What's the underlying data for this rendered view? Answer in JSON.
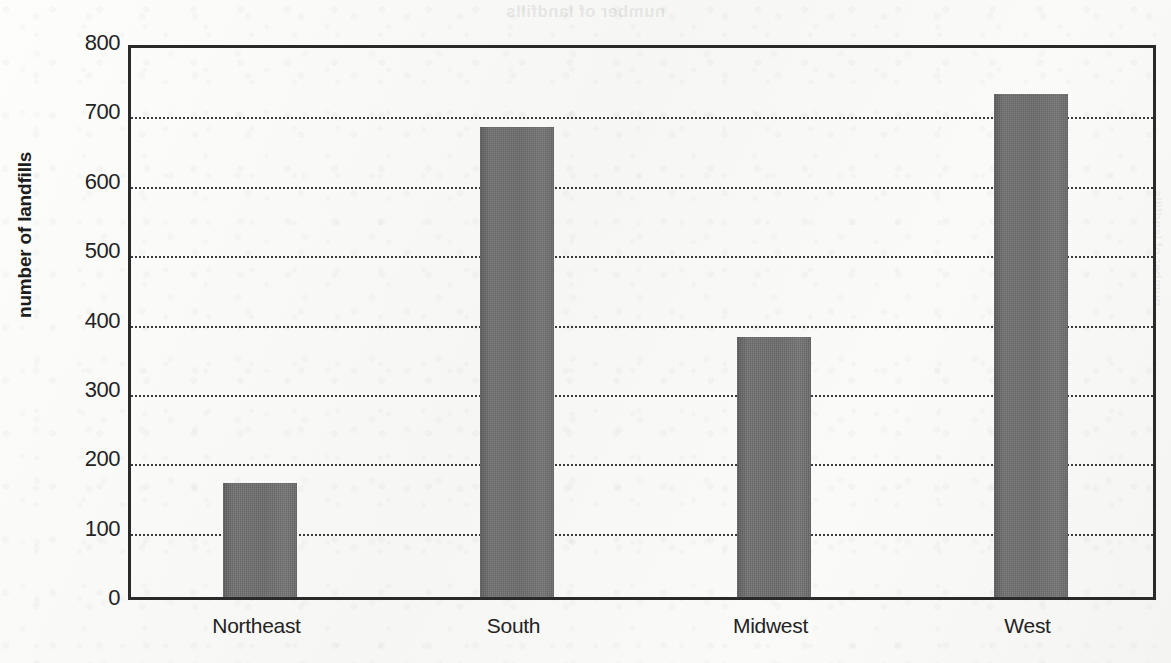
{
  "ghost": {
    "top_text": "number of landfills",
    "side_text": "number of landfills"
  },
  "chart_data": {
    "type": "bar",
    "title": "",
    "subtitle": "",
    "xlabel": "",
    "ylabel": "number of landfills",
    "categories": [
      "Northeast",
      "South",
      "Midwest",
      "West"
    ],
    "values": [
      165,
      678,
      375,
      725
    ],
    "series": [
      {
        "name": "number of landfills",
        "values": [
          165,
          678,
          375,
          725
        ]
      }
    ],
    "ylim": [
      0,
      800
    ],
    "y_ticks": [
      0,
      100,
      200,
      300,
      400,
      500,
      600,
      700,
      800
    ],
    "y_tick_labels": [
      "0",
      "100",
      "200",
      "300",
      "400",
      "500",
      "600",
      "700",
      "800"
    ],
    "gridlines": [
      100,
      200,
      300,
      400,
      500,
      600,
      700
    ],
    "grid": true,
    "grid_style": "dotted",
    "grid_axis": "y",
    "legend": false,
    "legend_position": "none",
    "bar_color": "#6f6f6f",
    "frame_color": "#2a2a2a",
    "background_color": "#f7f7f5",
    "annotations": []
  }
}
